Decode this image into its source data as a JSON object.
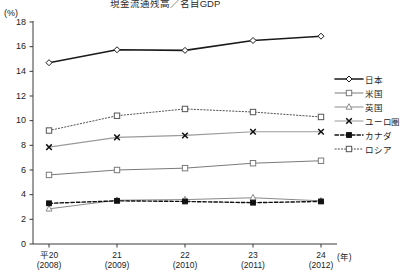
{
  "chart_data": {
    "type": "line",
    "title": "現金流通残高／名目GDP",
    "xlabel": "(年)",
    "ylabel": "(%)",
    "ylim": [
      0,
      18
    ],
    "yticks": [
      0,
      2,
      4,
      6,
      8,
      10,
      12,
      14,
      16,
      18
    ],
    "grid": false,
    "legend_position": "right",
    "categories": [
      "平20",
      "21",
      "22",
      "23",
      "24"
    ],
    "x_sublabels": [
      "(2008)",
      "(2009)",
      "(2010)",
      "(2011)",
      "(2012)"
    ],
    "series": [
      {
        "name": "日本",
        "marker": "diamond-open",
        "linestyle": "solid",
        "color": "#1a1a1a",
        "width": 1.6,
        "values": [
          14.7,
          15.75,
          15.7,
          16.5,
          16.85
        ]
      },
      {
        "name": "米国",
        "marker": "square-open",
        "linestyle": "solid",
        "color": "#7a7a7a",
        "width": 1.0,
        "values": [
          5.6,
          6.0,
          6.15,
          6.55,
          6.75
        ]
      },
      {
        "name": "英国",
        "marker": "triangle-open",
        "linestyle": "solid",
        "color": "#8a8a8a",
        "width": 1.0,
        "values": [
          2.85,
          3.55,
          3.6,
          3.75,
          3.5
        ]
      },
      {
        "name": "ユーロ圏",
        "marker": "cross-x",
        "linestyle": "solid",
        "color": "#9a9a9a",
        "width": 1.2,
        "values": [
          7.85,
          8.65,
          8.8,
          9.1,
          9.1
        ]
      },
      {
        "name": "カナダ",
        "marker": "square-solid",
        "linestyle": "dashed",
        "color": "#111111",
        "width": 1.4,
        "values": [
          3.3,
          3.5,
          3.45,
          3.35,
          3.45
        ]
      },
      {
        "name": "ロシア",
        "marker": "square-open",
        "linestyle": "dotted",
        "color": "#555555",
        "width": 1.0,
        "values": [
          9.2,
          10.4,
          10.95,
          10.7,
          10.3
        ]
      }
    ]
  },
  "legend": {
    "items": [
      {
        "label": "日本"
      },
      {
        "label": "米国"
      },
      {
        "label": "英国"
      },
      {
        "label": "ユーロ圏"
      },
      {
        "label": "カナダ"
      },
      {
        "label": "ロシア"
      }
    ]
  }
}
